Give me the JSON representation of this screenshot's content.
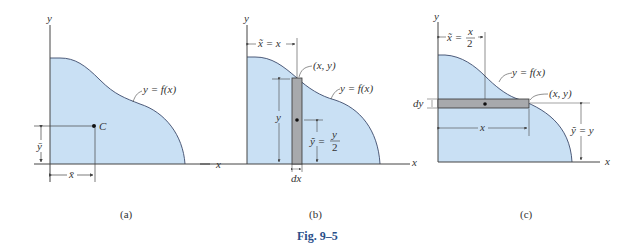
{
  "colors": {
    "fill": "#c9e0f4",
    "strip": "#a7a9ac",
    "axis": "#444444",
    "caption_blue": "#2a4f8a"
  },
  "figure_caption": "Fig. 9–5",
  "panels": [
    {
      "id": "a",
      "caption": "(a)",
      "axis_x": "x",
      "axis_y": "y",
      "curve_label": "y = f(x)",
      "centroid_label": "C",
      "xbar_label": "x̄",
      "ybar_label": "ȳ"
    },
    {
      "id": "b",
      "caption": "(b)",
      "axis_x": "x",
      "axis_y": "y",
      "curve_label": "y = f(x)",
      "point_label": "(x, y)",
      "xtilde_label": "x̃ = x",
      "height_label": "y",
      "ytilde_label": "ỹ =",
      "ytilde_num": "y",
      "ytilde_den": "2",
      "width_label": "dx"
    },
    {
      "id": "c",
      "caption": "(c)",
      "axis_x": "x",
      "axis_y": "y",
      "curve_label": "y = f(x)",
      "point_label": "(x, y)",
      "xtilde_label": "x̃ =",
      "xtilde_num": "x",
      "xtilde_den": "2",
      "length_label": "x",
      "ytilde_label": "ỹ = y",
      "thickness_label": "dy"
    }
  ]
}
